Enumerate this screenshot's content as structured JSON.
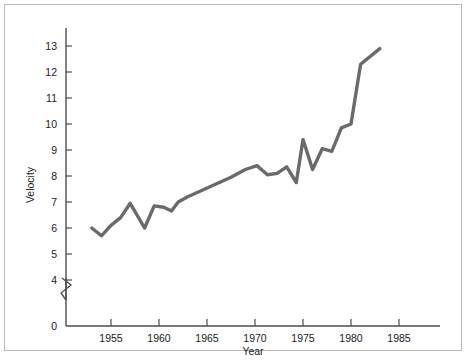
{
  "chart_data": {
    "type": "line",
    "title": "",
    "xlabel": "Year",
    "ylabel": "Velocity",
    "xlim": [
      1951,
      1988
    ],
    "ylim": [
      3.6,
      13.6
    ],
    "grid": false,
    "legend": null,
    "y_axis_break": true,
    "y_axis_break_note": "axis broken between 0 and 4",
    "xticks": [
      1955,
      1960,
      1965,
      1970,
      1975,
      1980,
      1985
    ],
    "xtick_labels": [
      "1955",
      "1960",
      "1965",
      "1970",
      "1975",
      "1980",
      "1985"
    ],
    "yticks": [
      0,
      4,
      5,
      6,
      7,
      8,
      9,
      10,
      11,
      12,
      13
    ],
    "ytick_labels": [
      "0",
      "4",
      "5",
      "6",
      "7",
      "8",
      "9",
      "10",
      "11",
      "12",
      "13"
    ],
    "series": [
      {
        "name": "Velocity",
        "color": "#6a6a6a",
        "x": [
          1953.0,
          1954.0,
          1955.0,
          1956.0,
          1957.0,
          1958.5,
          1959.5,
          1960.5,
          1961.3,
          1962.0,
          1963.0,
          1964.5,
          1966.0,
          1967.5,
          1969.0,
          1970.2,
          1971.3,
          1972.3,
          1973.3,
          1974.3,
          1975.0,
          1976.0,
          1977.0,
          1978.0,
          1979.0,
          1980.0,
          1981.0,
          1983.0
        ],
        "y": [
          6.0,
          5.7,
          6.1,
          6.4,
          6.95,
          6.0,
          6.85,
          6.8,
          6.65,
          7.0,
          7.2,
          7.45,
          7.7,
          7.95,
          8.25,
          8.4,
          8.05,
          8.1,
          8.35,
          7.75,
          9.4,
          8.25,
          9.05,
          8.95,
          9.85,
          10.0,
          12.3,
          12.9
        ]
      }
    ]
  },
  "axis_labels": {
    "y_title": "Velocity",
    "x_title": "Year"
  }
}
